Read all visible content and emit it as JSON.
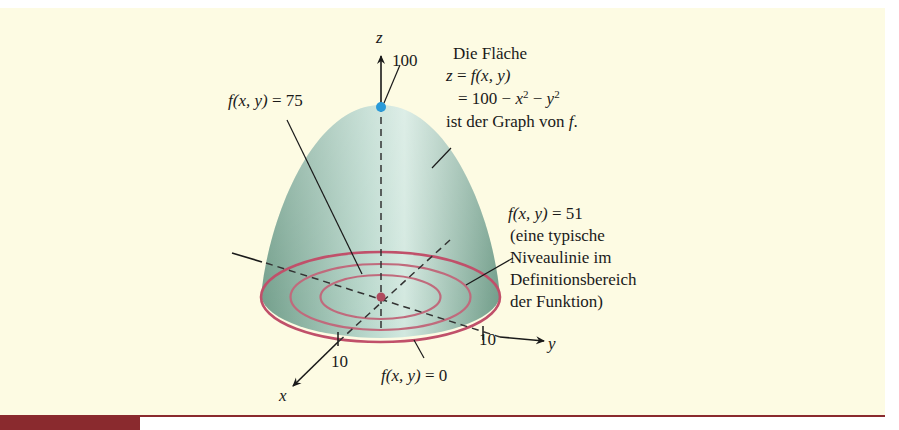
{
  "figure": {
    "background_color": "#fdfbe3",
    "surface_color": "#8fb9a6",
    "level_curve_color": "#c0506a",
    "peak_point_color": "#2a9ad8",
    "center_point_color": "#b04a5e",
    "rule_color": "#8a2a2e"
  },
  "axes": {
    "z_label": "z",
    "z_tick": "100",
    "x_label": "x",
    "x_tick": "10",
    "y_label": "y",
    "y_tick": "10"
  },
  "annotations": {
    "surface_title": "Die Fläche",
    "surface_eq1_lhs": "z",
    "surface_eq1_mid": " = ",
    "surface_eq1_rhs": "f(x, y)",
    "surface_eq2_prefix": "= 100 − ",
    "surface_eq2_x": "x",
    "surface_eq2_exp1": "2",
    "surface_eq2_minus": " − ",
    "surface_eq2_y": "y",
    "surface_eq2_exp2": "2",
    "surface_caption_text": "ist der Graph von ",
    "surface_caption_f": "f",
    "surface_caption_end": ".",
    "level75_fn": "f(x, y)",
    "level75_val": " = 75",
    "level51_fn": "f(x, y)",
    "level51_val": " = 51",
    "level51_note_1": "(eine typische",
    "level51_note_2": "Niveaulinie im",
    "level51_note_3": "Definitionsbereich",
    "level51_note_4": "der Funktion)",
    "level0_fn": "f(x, y)",
    "level0_val": " = 0"
  }
}
